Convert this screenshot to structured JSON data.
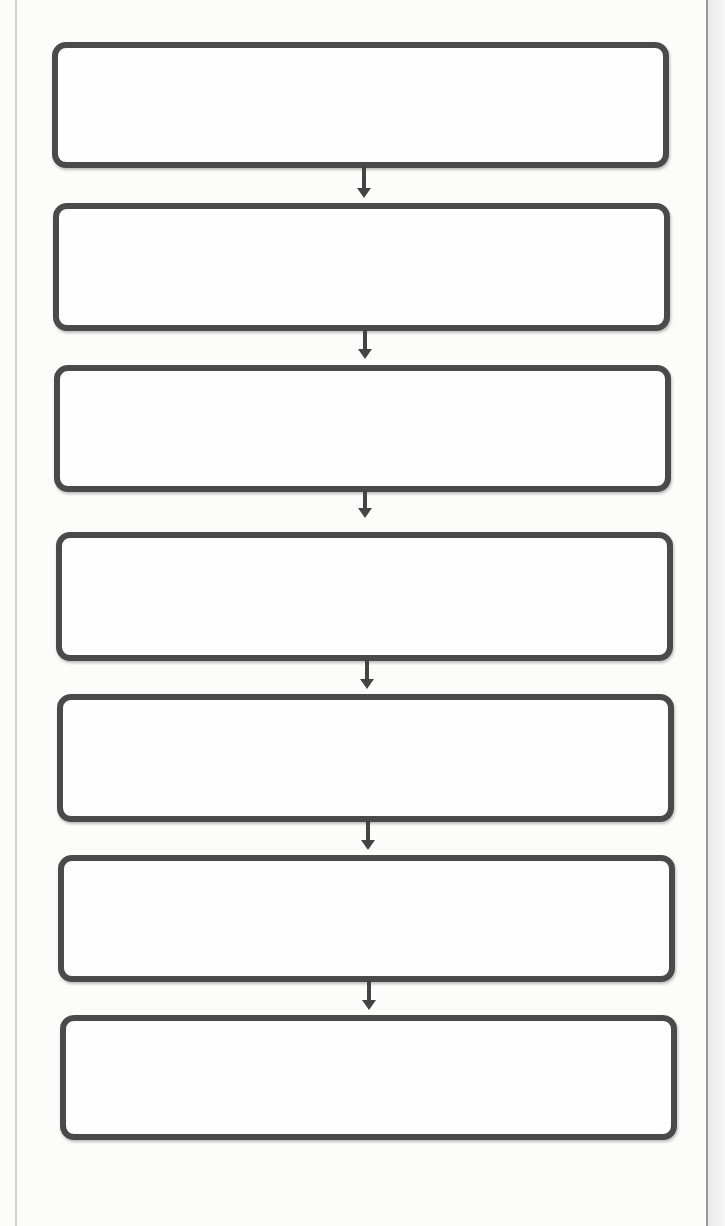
{
  "worksheet": {
    "type": "flowchart",
    "direction": "top-to-bottom",
    "colors": {
      "box_border": "#4a4a4a",
      "arrow": "#444444",
      "background": "#fcfcfb"
    },
    "boxes": [
      {
        "step": 1,
        "text": ""
      },
      {
        "step": 2,
        "text": ""
      },
      {
        "step": 3,
        "text": ""
      },
      {
        "step": 4,
        "text": ""
      },
      {
        "step": 5,
        "text": ""
      },
      {
        "step": 6,
        "text": ""
      },
      {
        "step": 7,
        "text": ""
      }
    ],
    "connectors": [
      {
        "from": 1,
        "to": 2,
        "icon": "down-arrow-icon"
      },
      {
        "from": 2,
        "to": 3,
        "icon": "down-arrow-icon"
      },
      {
        "from": 3,
        "to": 4,
        "icon": "down-arrow-icon"
      },
      {
        "from": 4,
        "to": 5,
        "icon": "down-arrow-icon"
      },
      {
        "from": 5,
        "to": 6,
        "icon": "down-arrow-icon"
      },
      {
        "from": 6,
        "to": 7,
        "icon": "down-arrow-icon"
      }
    ]
  }
}
